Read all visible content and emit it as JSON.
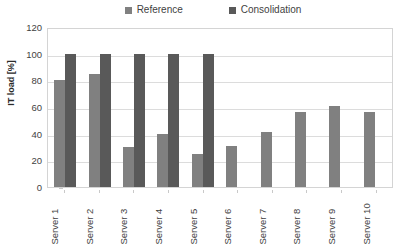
{
  "chart_data": {
    "type": "bar",
    "title": "",
    "xlabel": "",
    "ylabel": "IT load [%]",
    "ylim": [
      0,
      120
    ],
    "yticks": [
      0,
      20,
      40,
      60,
      80,
      100,
      120
    ],
    "grid": true,
    "legend_position": "top",
    "categories": [
      "Server 1",
      "Server 2",
      "Server 3",
      "Server 4",
      "Server 5",
      "Server 6",
      "Server 7",
      "Server 8",
      "Server 9",
      "Server 10"
    ],
    "series": [
      {
        "name": "Reference",
        "color": "#808080",
        "values": [
          80,
          85,
          30,
          40,
          25,
          31,
          41,
          56,
          61,
          56
        ]
      },
      {
        "name": "Consolidation",
        "color": "#595959",
        "values": [
          100,
          100,
          100,
          100,
          100,
          null,
          null,
          null,
          null,
          null
        ]
      }
    ]
  },
  "legend": {
    "items": [
      {
        "label": "Reference",
        "swatch_icon": "square-swatch-icon",
        "color": "#808080"
      },
      {
        "label": "Consolidation",
        "swatch_icon": "square-swatch-icon",
        "color": "#595959"
      }
    ]
  },
  "axes": {
    "y_title": "IT load [%]",
    "y_tick_labels": [
      "120",
      "100",
      "80",
      "60",
      "40",
      "20",
      "0"
    ],
    "x_tick_labels": [
      "Server 1",
      "Server 2",
      "Server 3",
      "Server 4",
      "Server 5",
      "Server 6",
      "Server 7",
      "Server 8",
      "Server 9",
      "Server 10"
    ]
  },
  "colors": {
    "reference": "#808080",
    "consolidation": "#595959",
    "gridline": "#dcdcdc",
    "plot_border": "#d4d4d4",
    "text": "#3f3f3f",
    "background": "#ffffff"
  }
}
